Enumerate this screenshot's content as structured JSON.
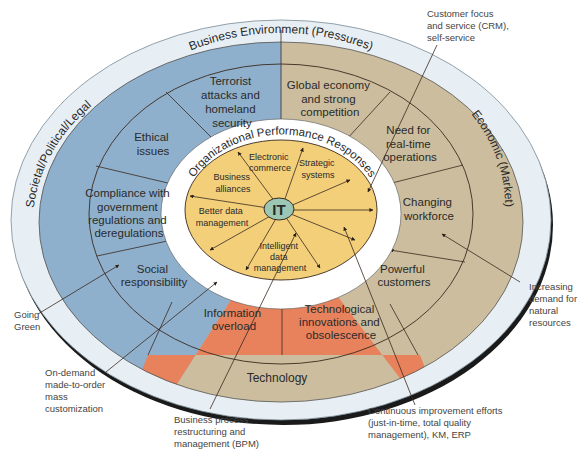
{
  "diagram": {
    "outer_ring_title": "Business Environment (Pressures)",
    "inner_ring_title": "Organizational Performance Responses",
    "center_label": "IT",
    "sectors": [
      {
        "name": "Societal/Political/Legal",
        "color": "#8fb0cc"
      },
      {
        "name": "Economic (Market)",
        "color": "#cbbd9d"
      },
      {
        "name": "Technology",
        "color": "#e8825c"
      }
    ],
    "pressures": {
      "terrorist": [
        "Terrorist",
        "attacks and",
        "homeland",
        "security"
      ],
      "global": [
        "Global economy",
        "and strong",
        "competition"
      ],
      "ethical": [
        "Ethical",
        "issues"
      ],
      "realtime": [
        "Need for",
        "real-time",
        "operations"
      ],
      "compliance": [
        "Compliance with",
        "government",
        "regulations and",
        "deregulations"
      ],
      "workforce": [
        "Changing",
        "workforce"
      ],
      "social": [
        "Social",
        "responsibility"
      ],
      "customers": [
        "Powerful",
        "customers"
      ],
      "overload": [
        "Information",
        "overload"
      ],
      "techinnov": [
        "Technological",
        "innovations and",
        "obsolescence"
      ]
    },
    "responses": {
      "ecommerce": [
        "Electronic",
        "commerce"
      ],
      "strategic": [
        "Strategic",
        "systems"
      ],
      "alliances": [
        "Business",
        "alliances"
      ],
      "betterdata": [
        "Better data",
        "management"
      ],
      "intelligent": [
        "Intelligent",
        "data",
        "management"
      ]
    },
    "callouts": {
      "crm": [
        "Customer focus",
        "and service (CRM),",
        "self-service"
      ],
      "green": [
        "Going",
        "Green"
      ],
      "natural": [
        "Increasing",
        "demand for",
        "natural",
        "resources"
      ],
      "ondemand": [
        "On-demand",
        "made-to-order",
        "mass",
        "customization"
      ],
      "bpm": [
        "Business process",
        "restructuring and",
        "management (BPM)"
      ],
      "continuous": [
        "Continuous improvement efforts",
        "(just-in-time, total quality",
        "management), KM, ERP"
      ]
    },
    "colors": {
      "outer_band": "#e6eef3",
      "yellow_core": "#f3cf7a",
      "it_badge": "#9cc7b5",
      "lines": "#3a2a20"
    }
  }
}
